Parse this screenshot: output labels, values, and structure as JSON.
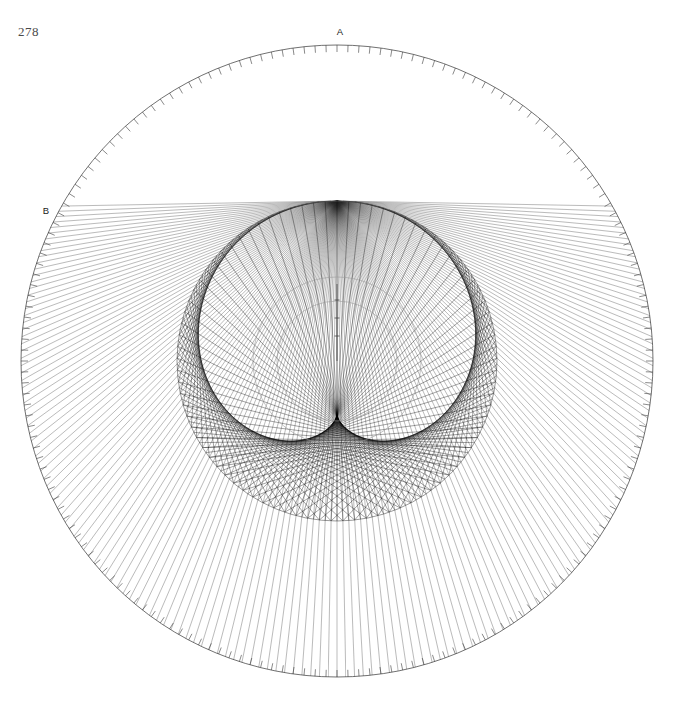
{
  "page": {
    "number": "278",
    "background_color": "#ffffff",
    "width": 673,
    "height": 701
  },
  "figure": {
    "type": "geometric-construction",
    "ink_color": "#111111",
    "faint_color": "#8a8a8a",
    "labels": [
      {
        "id": "A",
        "text": "A",
        "x": 340,
        "y": 35,
        "role": "radiant-point"
      },
      {
        "id": "B",
        "text": "B",
        "x": 46,
        "y": 214,
        "role": "boundary-point"
      }
    ]
  },
  "geometry": {
    "center": {
      "x": 337,
      "y": 361
    },
    "outer_circle": {
      "name": "graduated-circle",
      "radius": 316,
      "tick_count": 180,
      "tick_length": 7,
      "stroke": "#333333",
      "stroke_width": 0.7
    },
    "reflecting_circle": {
      "name": "reflecting-circle",
      "radius": 160,
      "stroke": "#555555",
      "stroke_width": 0.6,
      "source_angle_deg": -90,
      "ray_count": 170
    },
    "inner_circles": [
      {
        "name": "inner-circle-outer",
        "radius": 84,
        "stroke": "#9a9a9a"
      },
      {
        "name": "inner-circle-inner",
        "radius": 60,
        "stroke": "#9a9a9a"
      }
    ],
    "radius_line": {
      "name": "vertical-radius",
      "from": {
        "x": 337,
        "y": 361
      },
      "to": {
        "x": 337,
        "y": 284
      },
      "ticks": [
        300,
        318,
        336
      ]
    },
    "source_point": {
      "x": 337,
      "y": 45,
      "label": "A"
    },
    "incident_rays": {
      "count": 170,
      "description": "rays from A to points on the reflecting circle, continuing outward to the graduated circle",
      "stroke": "#2b2b2b",
      "stroke_width": 0.45
    },
    "reflected_rays": {
      "count": 170,
      "description": "rays reflected inside the reflecting circle, forming a cardioid caustic",
      "stroke": "#000000",
      "stroke_width": 0.45
    }
  },
  "chart_data": {
    "type": "scatter",
    "xlabel": "",
    "ylabel": "",
    "categories": [
      "outer graduated circle",
      "reflecting circle",
      "inner circle 1",
      "inner circle 2"
    ],
    "values": [
      316,
      160,
      84,
      60
    ]
  }
}
